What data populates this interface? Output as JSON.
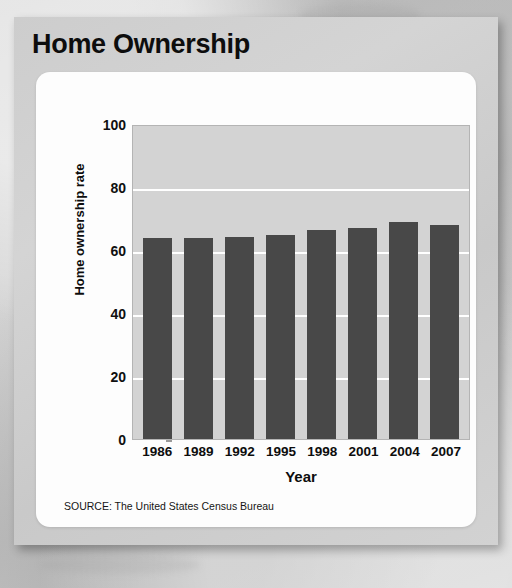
{
  "figure": {
    "title": "Home Ownership",
    "source_note": "SOURCE: The United States Census Bureau"
  },
  "colors": {
    "bar": "#484848",
    "plot_background": "#d3d3d3",
    "gridline": "#ffffff",
    "card_background": "#cdcdcd",
    "panel_background": "#fdfdfd",
    "text": "#0d0d0d"
  },
  "chart_data": {
    "type": "bar",
    "title": "Home Ownership",
    "categories": [
      "1986",
      "1989",
      "1992",
      "1995",
      "1998",
      "2001",
      "2004",
      "2007"
    ],
    "values": [
      63.8,
      63.9,
      64.1,
      64.7,
      66.3,
      67.1,
      69.0,
      68.1
    ],
    "xlabel": "Year",
    "ylabel": "Home ownership rate",
    "ylim": [
      0,
      100
    ],
    "yticks": [
      0,
      20,
      40,
      60,
      80,
      100
    ],
    "ytick_labels": [
      "0",
      "20",
      "40",
      "60",
      "80",
      "100"
    ],
    "grid": true,
    "gridlines_at": [
      20,
      40,
      60,
      80
    ],
    "legend": null,
    "source": "SOURCE: The United States Census Bureau"
  }
}
